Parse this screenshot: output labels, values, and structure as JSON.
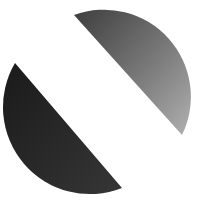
{
  "figure": {
    "colors": {
      "background": "#ffffff",
      "upper_segment_dark": "#4a4a4a",
      "upper_segment_light": "#a8a8a8",
      "lower_segment_dark": "#1e1e1e",
      "lower_segment_light": "#3a3a3a"
    }
  }
}
